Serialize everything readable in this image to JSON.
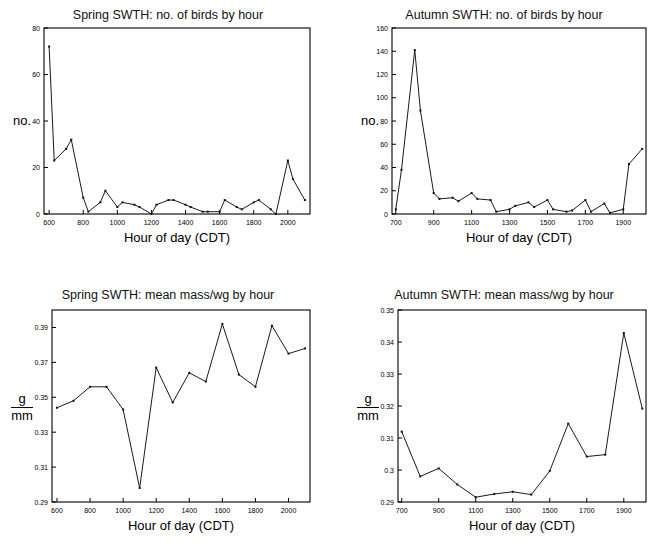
{
  "figure": {
    "panels": [
      {
        "id": "spring-count",
        "title": "Spring SWTH: no. of birds by hour",
        "xlabel": "Hour of day (CDT)",
        "ylabel": "no.",
        "ylabel_kind": "plain"
      },
      {
        "id": "autumn-count",
        "title": "Autumn SWTH: no. of birds by hour",
        "xlabel": "Hour of day (CDT)",
        "ylabel": "no.",
        "ylabel_kind": "plain"
      },
      {
        "id": "spring-mass",
        "title": "Spring SWTH: mean mass/wg by hour",
        "xlabel": "Hour of day (CDT)",
        "ylabel_num": "g",
        "ylabel_den": "mm",
        "ylabel_kind": "fraction"
      },
      {
        "id": "autumn-mass",
        "title": "Autumn SWTH: mean mass/wg by hour",
        "xlabel": "Hour of day (CDT)",
        "ylabel_num": "g",
        "ylabel_den": "mm",
        "ylabel_kind": "fraction"
      }
    ]
  },
  "chart_data": [
    {
      "type": "line",
      "id": "spring-count",
      "title": "Spring SWTH: no. of birds by hour",
      "xlabel": "Hour of day (CDT)",
      "ylabel": "no.",
      "xlim": [
        570,
        2130
      ],
      "ylim": [
        0,
        80
      ],
      "xticks": [
        600,
        800,
        1000,
        1200,
        1400,
        1600,
        1800,
        2000
      ],
      "xticklabels": [
        "600",
        "800",
        "1000",
        "1200",
        "1400",
        "1600",
        "1800",
        "2000"
      ],
      "yticks": [
        0,
        20,
        40,
        60,
        80
      ],
      "yticklabels": [
        "0",
        "20",
        "40",
        "60",
        "80"
      ],
      "grid": false,
      "legend": false,
      "markers": true,
      "x": [
        600,
        630,
        700,
        730,
        800,
        830,
        900,
        930,
        1000,
        1030,
        1100,
        1130,
        1200,
        1230,
        1300,
        1330,
        1400,
        1430,
        1500,
        1530,
        1600,
        1630,
        1700,
        1730,
        1800,
        1830,
        1900,
        1930,
        2000,
        2030,
        2100
      ],
      "y": [
        72,
        23,
        28,
        32,
        7,
        1,
        5,
        10,
        3,
        5,
        4,
        3,
        0,
        4,
        6,
        6,
        4,
        3,
        1,
        1,
        1,
        6,
        3,
        2,
        5,
        6,
        2,
        0,
        23,
        15,
        6
      ]
    },
    {
      "type": "line",
      "id": "autumn-count",
      "title": "Autumn SWTH: no. of birds by hour",
      "xlabel": "Hour of day (CDT)",
      "ylabel": "no.",
      "xlim": [
        680,
        2020
      ],
      "ylim": [
        0,
        160
      ],
      "xticks": [
        700,
        900,
        1100,
        1300,
        1500,
        1700,
        1900
      ],
      "xticklabels": [
        "700",
        "900",
        "1100",
        "1300",
        "1500",
        "1700",
        "1900"
      ],
      "yticks": [
        0,
        20,
        40,
        60,
        80,
        100,
        120,
        140,
        160
      ],
      "yticklabels": [
        "0",
        "20",
        "40",
        "60",
        "80",
        "100",
        "120",
        "140",
        "160"
      ],
      "grid": false,
      "legend": false,
      "markers": true,
      "x": [
        700,
        730,
        800,
        830,
        900,
        930,
        1000,
        1030,
        1100,
        1130,
        1200,
        1230,
        1300,
        1330,
        1400,
        1430,
        1500,
        1530,
        1600,
        1630,
        1700,
        1730,
        1800,
        1830,
        1900,
        1930,
        2000
      ],
      "y": [
        4,
        38,
        141,
        89,
        18,
        13,
        14,
        11,
        18,
        13,
        12,
        2,
        4,
        7,
        10,
        6,
        12,
        4,
        2,
        3,
        12,
        2,
        9,
        1,
        4,
        43,
        56
      ]
    },
    {
      "type": "line",
      "id": "spring-mass",
      "title": "Spring SWTH: mean mass/wg by hour",
      "xlabel": "Hour of day (CDT)",
      "ylabel": "g/mm",
      "xlim": [
        570,
        2130
      ],
      "ylim": [
        0.29,
        0.4
      ],
      "xticks": [
        600,
        800,
        1000,
        1200,
        1400,
        1600,
        1800,
        2000
      ],
      "xticklabels": [
        "600",
        "800",
        "1000",
        "1200",
        "1400",
        "1600",
        "1800",
        "2000"
      ],
      "yticks": [
        0.29,
        0.31,
        0.33,
        0.35,
        0.37,
        0.39
      ],
      "yticklabels": [
        "0.29",
        "0.31",
        "0.33",
        "0.35",
        "0.37",
        "0.39"
      ],
      "grid": false,
      "legend": false,
      "markers": true,
      "x": [
        600,
        700,
        800,
        900,
        1000,
        1100,
        1200,
        1300,
        1400,
        1500,
        1600,
        1700,
        1800,
        1900,
        2000,
        2100
      ],
      "y": [
        0.344,
        0.348,
        0.356,
        0.356,
        0.343,
        0.298,
        0.367,
        0.347,
        0.364,
        0.359,
        0.392,
        0.363,
        0.356,
        0.391,
        0.375,
        0.378
      ]
    },
    {
      "type": "line",
      "id": "autumn-mass",
      "title": "Autumn SWTH: mean mass/wg by hour",
      "xlabel": "Hour of day (CDT)",
      "ylabel": "g/mm",
      "xlim": [
        680,
        2020
      ],
      "ylim": [
        0.29,
        0.35
      ],
      "xticks": [
        700,
        900,
        1100,
        1300,
        1500,
        1700,
        1900
      ],
      "xticklabels": [
        "700",
        "900",
        "1100",
        "1300",
        "1500",
        "1700",
        "1900"
      ],
      "yticks": [
        0.29,
        0.3,
        0.31,
        0.32,
        0.33,
        0.34,
        0.35
      ],
      "yticklabels": [
        "0.29",
        "0.3",
        "0.31",
        "0.32",
        "0.33",
        "0.34",
        "0.35"
      ],
      "grid": false,
      "legend": false,
      "markers": true,
      "x": [
        700,
        800,
        900,
        1000,
        1100,
        1200,
        1300,
        1400,
        1500,
        1600,
        1700,
        1800,
        1900,
        2000
      ],
      "y": [
        0.312,
        0.298,
        0.3005,
        0.2955,
        0.2915,
        0.2925,
        0.2932,
        0.2923,
        0.2997,
        0.3145,
        0.3042,
        0.3048,
        0.3428,
        0.3192
      ]
    }
  ]
}
